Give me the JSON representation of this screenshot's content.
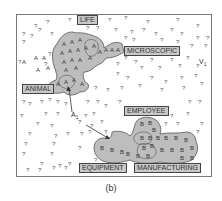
{
  "caption": "(b)",
  "colors": {
    "region_fill": "#bdbdbd",
    "region_stroke": "#555555",
    "label_fill": "#c8c8c8",
    "label_stroke": "#444444",
    "text": "#333333",
    "frame": "#7a7a7a",
    "question_mark": "#555555"
  },
  "labels": [
    {
      "id": "life",
      "text": "LIFE",
      "x": 77,
      "y": 17
    },
    {
      "id": "microscopic",
      "text": "MICROSCOPIC",
      "x": 124,
      "y": 48
    },
    {
      "id": "animal",
      "text": "ANIMAL",
      "x": 22,
      "y": 86
    },
    {
      "id": "employee",
      "text": "EMPLOYEE",
      "x": 124,
      "y": 108
    },
    {
      "id": "equipment",
      "text": "EQUIPMENT",
      "x": 79,
      "y": 165
    },
    {
      "id": "manufacturing",
      "text": "MANUFACTURING",
      "x": 134,
      "y": 165
    }
  ],
  "annotations": [
    {
      "id": "v1",
      "text": "V",
      "sub": "1",
      "x": 200,
      "y": 65
    },
    {
      "id": "a1",
      "text": "A",
      "sub": "1",
      "x": 72,
      "y": 117
    }
  ],
  "regions": {
    "A": {
      "symbol": "A"
    },
    "B": {
      "symbol": "B"
    }
  },
  "unknown_symbol": "?"
}
